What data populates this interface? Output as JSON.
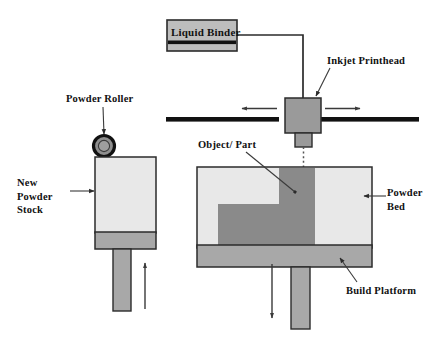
{
  "diagram": {
    "labels": {
      "liquid_binder": "Liquid Binder",
      "inkjet_printhead": "Inkjet Printhead",
      "powder_roller": "Powder Roller",
      "object_part": "Object/ Part",
      "new_powder_stock": "New\nPowder\nStock",
      "powder_bed": "Powder\nBed",
      "build_platform": "Build Platform"
    },
    "colors": {
      "outline": "#2b2b2b",
      "rail": "#111111",
      "light_powder": "#e8e8e8",
      "mid_gray": "#a8a8a8",
      "dark_part": "#8a8a8a",
      "printhead": "#9a9a9a",
      "binder_box": "#bdbdbd",
      "background": "#ffffff",
      "leader": "#3a3a3a"
    },
    "motion": {
      "printhead_left_arrow": "left",
      "printhead_right_arrow": "right",
      "powder_piston_arrow": "up",
      "build_piston_arrow": "down"
    },
    "binder_flow": "dotted-jet-from-nozzle-to-bed"
  }
}
